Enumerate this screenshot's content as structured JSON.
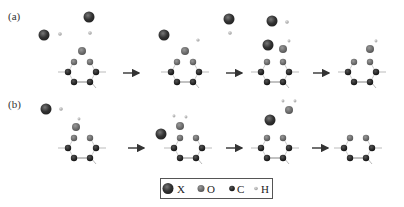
{
  "panels": [
    {
      "label": "(a)",
      "steps": 4
    },
    {
      "label": "(b)",
      "steps": 4
    }
  ],
  "legend": {
    "items": [
      {
        "symbol": "X",
        "label": "X",
        "color": "#333333",
        "size": "large"
      },
      {
        "symbol": "O",
        "label": "O",
        "color": "#555555",
        "size": "medium"
      },
      {
        "symbol": "C",
        "label": "C",
        "color": "#1a1a1a",
        "size": "small"
      },
      {
        "symbol": "H",
        "label": "H",
        "color": "#aaaaaa",
        "size": "tiny"
      }
    ]
  },
  "colors": {
    "x_atom": "#333333",
    "o_atom": "#5a5a5a",
    "c_atom": "#1c1c1c",
    "h_atom": "#a8a8a8",
    "bond": "#bbbbbb",
    "arrow": "#333333"
  }
}
